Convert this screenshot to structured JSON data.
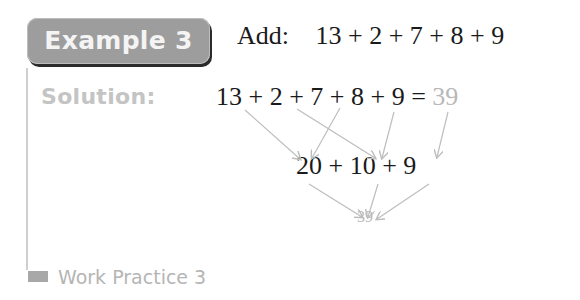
{
  "example": {
    "badge_label": "Example 3",
    "instruction": "Add:",
    "expression": "13 + 2 + 7 + 8 + 9"
  },
  "solution": {
    "label": "Solution:",
    "step1": {
      "expression": "13 + 2 + 7 + 8 + 9 =",
      "result": "39"
    },
    "step2": {
      "expression": "20 + 10 + 9"
    },
    "final_result": "39",
    "groupings": [
      {
        "terms": [
          "13",
          "7"
        ],
        "sum": "20"
      },
      {
        "terms": [
          "2",
          "8"
        ],
        "sum": "10"
      },
      {
        "terms": [
          "9"
        ],
        "sum": "9"
      }
    ]
  },
  "work_practice": {
    "label": "Work Practice 3"
  },
  "colors": {
    "badge_bg": "#9d9d9d",
    "muted_text": "#c4c4c4",
    "arrow": "#bdbdbd"
  }
}
